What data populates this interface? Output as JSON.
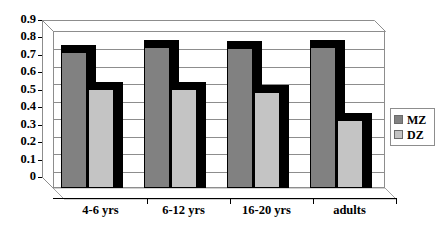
{
  "chart_data": {
    "type": "bar",
    "title": "",
    "xlabel": "",
    "ylabel": "",
    "categories": [
      "4-6 yrs",
      "6-12 yrs",
      "16-20 yrs",
      "adults"
    ],
    "series": [
      {
        "name": "MZ",
        "values": [
          0.78,
          0.81,
          0.8,
          0.81
        ],
        "color": "#818181"
      },
      {
        "name": "DZ",
        "values": [
          0.57,
          0.57,
          0.55,
          0.39
        ],
        "color": "#c4c4c4"
      }
    ],
    "ylim": [
      0,
      0.9
    ],
    "yticks": [
      "0.9",
      "0.8",
      "0.7",
      "0.6",
      "0.5",
      "0.4",
      "0.3",
      "0.2",
      "0.1",
      "0"
    ],
    "ytick_values": [
      0.9,
      0.8,
      0.7,
      0.6,
      0.5,
      0.4,
      0.3,
      0.2,
      0.1,
      0
    ],
    "grid": true,
    "legend_position": "right",
    "style": "3d-clustered-column"
  },
  "legend": {
    "entries": [
      {
        "label": "MZ",
        "color": "#818181"
      },
      {
        "label": "DZ",
        "color": "#c4c4c4"
      }
    ]
  },
  "axis": {
    "y_labels": [
      "0.9",
      "0.8",
      "0.7",
      "0.6",
      "0.5",
      "0.4",
      "0.3",
      "0.2",
      "0.1",
      "0"
    ],
    "x_labels": [
      "4-6 yrs",
      "6-12 yrs",
      "16-20 yrs",
      "adults"
    ]
  },
  "colors": {
    "mz": "#818181",
    "dz": "#c4c4c4",
    "grid": "#8d8d8d",
    "outline": "#000000",
    "background": "#ffffff"
  }
}
